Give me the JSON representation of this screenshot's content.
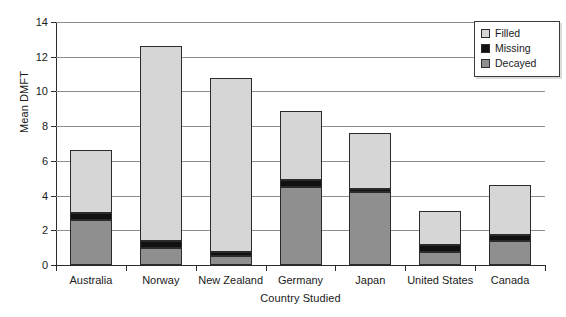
{
  "chart_data": {
    "type": "bar",
    "stacked": true,
    "title": "",
    "xlabel": "Country Studied",
    "ylabel": "Mean DMFT",
    "categories": [
      "Australia",
      "Norway",
      "New Zealand",
      "Germany",
      "Japan",
      "United States",
      "Canada"
    ],
    "series": [
      {
        "name": "Decayed",
        "color": "#8f8f8f",
        "values": [
          2.6,
          1.0,
          0.5,
          4.5,
          4.2,
          0.75,
          1.4
        ]
      },
      {
        "name": "Missing",
        "color": "#111111",
        "values": [
          0.4,
          0.4,
          0.25,
          0.4,
          0.2,
          0.4,
          0.3
        ]
      },
      {
        "name": "Filled",
        "color": "#d6d6d6",
        "values": [
          3.6,
          11.2,
          10.05,
          4.0,
          3.2,
          1.95,
          2.9
        ]
      }
    ],
    "stack_order_bottom_to_top": [
      "Decayed",
      "Missing",
      "Filled"
    ],
    "totals": [
      6.6,
      12.6,
      10.8,
      8.9,
      7.6,
      3.1,
      4.6
    ],
    "ylim": [
      0,
      14
    ],
    "yticks": [
      0,
      2,
      4,
      6,
      8,
      10,
      12,
      14
    ],
    "ytick_labels": [
      "0",
      "2",
      "4",
      "6",
      "8",
      "10",
      "12",
      "14"
    ],
    "grid": "horizontal",
    "legend_position": "top-right",
    "legend_entries": [
      "Filled",
      "Missing",
      "Decayed"
    ],
    "colors": {
      "filled": "#d6d6d6",
      "missing": "#111111",
      "decayed": "#8f8f8f",
      "axis": "#2b2b2b",
      "grid": "#8d8d8d",
      "background": "#ffffff"
    }
  }
}
